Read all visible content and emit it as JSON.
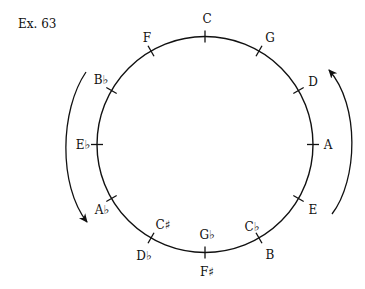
{
  "example_label": "Ex. 63",
  "diagram": {
    "type": "circle-of-fifths",
    "stroke_color": "#111111",
    "circle": {
      "cx": 205,
      "cy": 144.5,
      "r": 108
    },
    "notes": [
      {
        "label": "C",
        "x": 207,
        "y": 19
      },
      {
        "label": "G",
        "x": 270,
        "y": 38
      },
      {
        "label": "D",
        "x": 313,
        "y": 82
      },
      {
        "label": "A",
        "x": 328,
        "y": 145
      },
      {
        "label": "E",
        "x": 313,
        "y": 210
      },
      {
        "label": "C♭",
        "x": 252,
        "y": 227
      },
      {
        "label": "B",
        "x": 270,
        "y": 255
      },
      {
        "label": "G♭",
        "x": 207,
        "y": 235
      },
      {
        "label": "F♯",
        "x": 207,
        "y": 272
      },
      {
        "label": "C♯",
        "x": 163,
        "y": 225
      },
      {
        "label": "D♭",
        "x": 144,
        "y": 256
      },
      {
        "label": "A♭",
        "x": 102,
        "y": 210
      },
      {
        "label": "E♭",
        "x": 83,
        "y": 145
      },
      {
        "label": "B♭",
        "x": 101,
        "y": 80
      },
      {
        "label": "F",
        "x": 147,
        "y": 38
      }
    ],
    "arrows": {
      "left": {
        "direction": "counterclockwise (downward)"
      },
      "right": {
        "direction": "clockwise (upward)"
      }
    }
  }
}
